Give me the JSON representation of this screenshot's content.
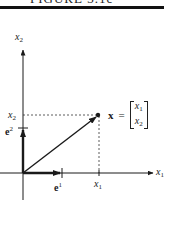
{
  "header": {
    "title": "FIGURE 3.1c"
  },
  "diagram": {
    "type": "vector-in-plane",
    "axes": {
      "x_axis_label": "x",
      "x_axis_sub": "1",
      "y_axis_label": "x",
      "y_axis_sub": "2"
    },
    "ticks": {
      "x_tick_label": "x",
      "x_tick_sub": "1",
      "y_tick_label": "x",
      "y_tick_sub": "2"
    },
    "basis": {
      "e1_label": "e",
      "e1_sup": "1",
      "e2_label": "e",
      "e2_sup": "2"
    },
    "equation": {
      "vector_name": "x",
      "equals": "=",
      "components": [
        {
          "base": "x",
          "sub": "1"
        },
        {
          "base": "x",
          "sub": "2"
        }
      ]
    },
    "colors": {
      "ink": "#1a1a1a",
      "background": "#ffffff"
    }
  }
}
